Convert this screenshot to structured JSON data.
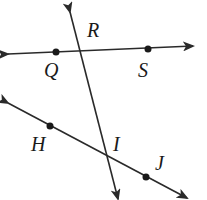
{
  "diagram": {
    "type": "geometry-lines",
    "stroke_color": "#2a2a2a",
    "lines": [
      {
        "name": "line-QS",
        "points": [
          "Q",
          "S"
        ],
        "from": [
          8,
          54
        ],
        "to": [
          193,
          46
        ]
      },
      {
        "name": "line-HJ",
        "points": [
          "H",
          "I",
          "J"
        ],
        "from": [
          8,
          103
        ],
        "to": [
          187,
          198
        ]
      },
      {
        "name": "line-RI",
        "points": [
          "R",
          "I"
        ],
        "from": [
          70,
          12
        ],
        "to": [
          118,
          199
        ]
      }
    ],
    "points": [
      {
        "label": "Q",
        "x": 56,
        "y": 52,
        "dot": true,
        "label_x": 44,
        "label_y": 60
      },
      {
        "label": "S",
        "x": 148,
        "y": 49,
        "dot": true,
        "label_x": 138,
        "label_y": 60
      },
      {
        "label": "R",
        "x": 80,
        "y": 51,
        "dot": false,
        "label_x": 87,
        "label_y": 24
      },
      {
        "label": "H",
        "x": 50,
        "y": 126,
        "dot": true,
        "label_x": 31,
        "label_y": 135
      },
      {
        "label": "I",
        "x": 108,
        "y": 157,
        "dot": false,
        "label_x": 112,
        "label_y": 133
      },
      {
        "label": "J",
        "x": 146,
        "y": 177,
        "dot": true,
        "label_x": 155,
        "label_y": 153
      }
    ]
  },
  "labels": {
    "Q": "Q",
    "S": "S",
    "R": "R",
    "H": "H",
    "I": "I",
    "J": "J"
  }
}
